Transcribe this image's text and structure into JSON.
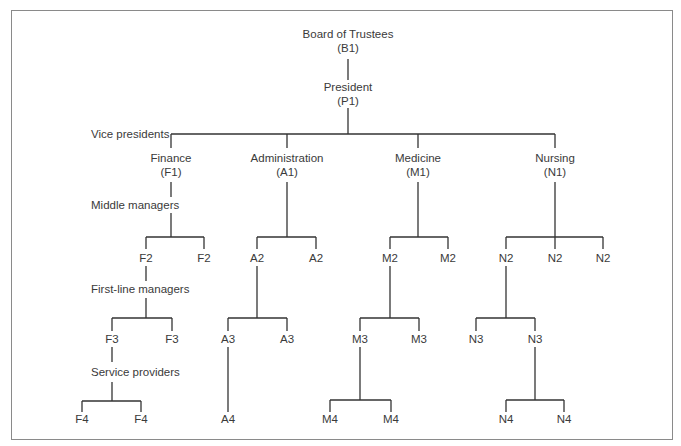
{
  "diagram": {
    "type": "organizational-chart",
    "border_color": "#8a8a8a",
    "line_color": "#333333",
    "top": {
      "board": {
        "name": "Board of Trustees",
        "code": "(B1)"
      },
      "president": {
        "name": "President",
        "code": "(P1)"
      }
    },
    "level_labels": {
      "vice_presidents": "Vice presidents",
      "middle_managers": "Middle managers",
      "first_line_managers": "First-line managers",
      "service_providers": "Service providers"
    },
    "divisions": [
      {
        "name": "Finance",
        "code": "(F1)",
        "level2": [
          "F2",
          "F2"
        ],
        "level3": [
          "F3",
          "F3"
        ],
        "level4": [
          "F4",
          "F4"
        ]
      },
      {
        "name": "Administration",
        "code": "(A1)",
        "level2": [
          "A2",
          "A2"
        ],
        "level3": [
          "A3",
          "A3"
        ],
        "level4": [
          "A4"
        ]
      },
      {
        "name": "Medicine",
        "code": "(M1)",
        "level2": [
          "M2",
          "M2"
        ],
        "level3": [
          "M3",
          "M3"
        ],
        "level4": [
          "M4",
          "M4"
        ]
      },
      {
        "name": "Nursing",
        "code": "(N1)",
        "level2": [
          "N2",
          "N2",
          "N2"
        ],
        "level3": [
          "N3",
          "N3"
        ],
        "level4": [
          "N4",
          "N4"
        ]
      }
    ]
  }
}
